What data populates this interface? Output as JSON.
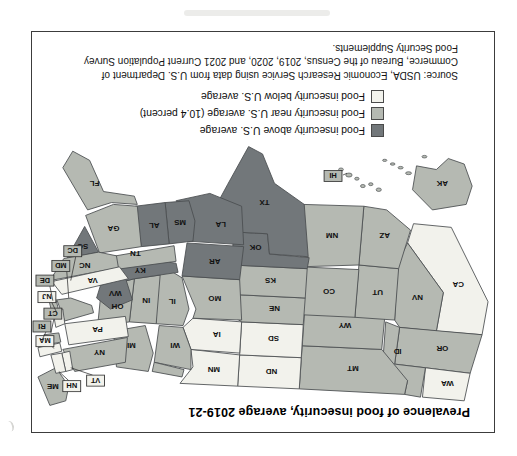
{
  "figure": {
    "title": "Prevalence of food insecurity, average 2019-21",
    "source_lines": [
      "Source: USDA, Economic Research Service using data from U.S. Department of",
      "Commerce, Bureau of the Census, 2019, 2020, and 2021 Current Population Survey",
      "Food Security Supplements."
    ]
  },
  "legend": {
    "items": [
      {
        "category": "above",
        "label": "Food insecurity above U.S. average"
      },
      {
        "category": "near",
        "label": "Food insecurity near U.S. average (10.4 percent)"
      },
      {
        "category": "below",
        "label": "Food insecurity below U.S. average"
      }
    ]
  },
  "colors": {
    "above": "#72777a",
    "near": "#b5b9b2",
    "below": "#f2f2ec",
    "state_border": "#4a4e50",
    "box_border": "#333333",
    "label_text": "#111111",
    "frame_border": "#3c3c3c"
  },
  "map": {
    "us_average_percent_label": "10.4 percent",
    "boxed_label_states": [
      "VT",
      "NH",
      "MA",
      "RI",
      "CT",
      "NJ",
      "DE",
      "MD",
      "DC",
      "HI"
    ],
    "states": [
      {
        "abbr": "WA",
        "category": "below"
      },
      {
        "abbr": "OR",
        "category": "near"
      },
      {
        "abbr": "CA",
        "category": "below"
      },
      {
        "abbr": "NV",
        "category": "near"
      },
      {
        "abbr": "ID",
        "category": "near"
      },
      {
        "abbr": "MT",
        "category": "near"
      },
      {
        "abbr": "WY",
        "category": "near"
      },
      {
        "abbr": "UT",
        "category": "near"
      },
      {
        "abbr": "CO",
        "category": "near"
      },
      {
        "abbr": "AZ",
        "category": "near"
      },
      {
        "abbr": "NM",
        "category": "near"
      },
      {
        "abbr": "ND",
        "category": "below"
      },
      {
        "abbr": "SD",
        "category": "below"
      },
      {
        "abbr": "NE",
        "category": "near"
      },
      {
        "abbr": "KS",
        "category": "near"
      },
      {
        "abbr": "OK",
        "category": "above"
      },
      {
        "abbr": "TX",
        "category": "above"
      },
      {
        "abbr": "MN",
        "category": "below"
      },
      {
        "abbr": "IA",
        "category": "below"
      },
      {
        "abbr": "MO",
        "category": "near"
      },
      {
        "abbr": "AR",
        "category": "above"
      },
      {
        "abbr": "LA",
        "category": "above"
      },
      {
        "abbr": "WI",
        "category": "near"
      },
      {
        "abbr": "IL",
        "category": "near"
      },
      {
        "abbr": "MI",
        "category": "near"
      },
      {
        "abbr": "IN",
        "category": "near"
      },
      {
        "abbr": "OH",
        "category": "near"
      },
      {
        "abbr": "KY",
        "category": "above"
      },
      {
        "abbr": "TN",
        "category": "near"
      },
      {
        "abbr": "MS",
        "category": "above"
      },
      {
        "abbr": "AL",
        "category": "above"
      },
      {
        "abbr": "GA",
        "category": "near"
      },
      {
        "abbr": "FL",
        "category": "near"
      },
      {
        "abbr": "SC",
        "category": "above"
      },
      {
        "abbr": "NC",
        "category": "near"
      },
      {
        "abbr": "VA",
        "category": "below"
      },
      {
        "abbr": "WV",
        "category": "above"
      },
      {
        "abbr": "PA",
        "category": "below"
      },
      {
        "abbr": "NY",
        "category": "near"
      },
      {
        "abbr": "ME",
        "category": "near"
      },
      {
        "abbr": "VT",
        "category": "below"
      },
      {
        "abbr": "NH",
        "category": "below"
      },
      {
        "abbr": "MA",
        "category": "below"
      },
      {
        "abbr": "RI",
        "category": "near"
      },
      {
        "abbr": "CT",
        "category": "near"
      },
      {
        "abbr": "NJ",
        "category": "below"
      },
      {
        "abbr": "DE",
        "category": "near"
      },
      {
        "abbr": "MD",
        "category": "near"
      },
      {
        "abbr": "DC",
        "category": "near"
      },
      {
        "abbr": "AK",
        "category": "near"
      },
      {
        "abbr": "HI",
        "category": "near"
      }
    ]
  }
}
